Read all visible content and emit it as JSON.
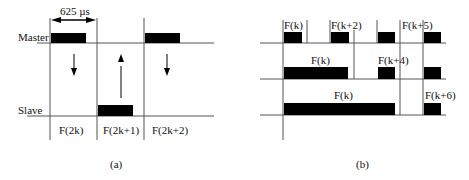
{
  "panel_a": {
    "caption": "(a)",
    "duration_label": "625 µs",
    "row_labels": {
      "master": "Master",
      "slave": "Slave"
    },
    "slots": [
      {
        "label": "F(2k)",
        "direction": "down"
      },
      {
        "label": "F(2k+1)",
        "direction": "up"
      },
      {
        "label": "F(2k+2)",
        "direction": "down"
      }
    ]
  },
  "panel_b": {
    "caption": "(b)",
    "rows": [
      {
        "labels": [
          "F(k)",
          "F(k+2)",
          "F(k+5)"
        ]
      },
      {
        "labels": [
          "F(k)",
          "F(k+4)"
        ]
      },
      {
        "labels": [
          "F(k)",
          "F(k+6)"
        ]
      }
    ]
  },
  "colors": {
    "line": "#555555",
    "block": "#000000"
  }
}
